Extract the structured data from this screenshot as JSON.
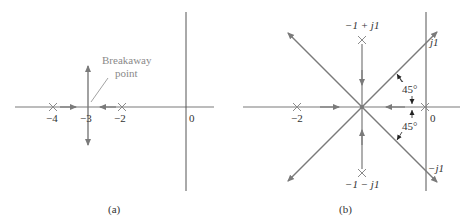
{
  "colors": {
    "locus": "#7a7a7a",
    "axis": "#555555",
    "text": "#333333",
    "annotation": "#8a8a8a"
  },
  "panel_a": {
    "caption": "(a)",
    "annotation": "Breakaway point",
    "annotation_line1": "Breakaway",
    "annotation_line2": "point",
    "ticks": {
      "m4": "−4",
      "m3": "−3",
      "m2": "−2",
      "zero": "0"
    },
    "poles": [
      -4,
      -2
    ],
    "breakaway": -3
  },
  "panel_b": {
    "caption": "(b)",
    "ticks": {
      "m2": "−2",
      "zero": "0",
      "j1": "j1",
      "mj1": "−j1"
    },
    "pole_labels": {
      "upper": "−1 + j1",
      "lower": "−1 − j1"
    },
    "angle_labels": {
      "upper": "45°",
      "lower": "45°"
    },
    "poles": [
      "-2",
      "0",
      "-1+j1",
      "-1-j1"
    ],
    "asymptote_center": -1
  }
}
